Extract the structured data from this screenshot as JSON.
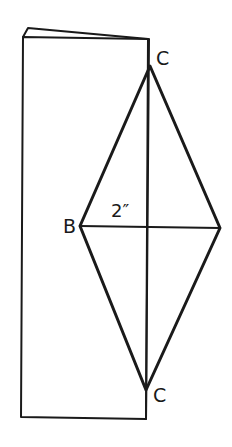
{
  "diagram": {
    "stroke_color": "#1a1a1a",
    "background_color": "#ffffff",
    "labels": {
      "top_vertex": "C",
      "left_vertex": "B",
      "bottom_vertex": "C",
      "dimension": "2″"
    }
  }
}
